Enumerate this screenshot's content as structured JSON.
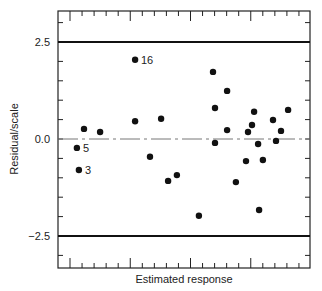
{
  "chart_data": {
    "type": "scatter",
    "title": "",
    "xlabel": "Estimated response",
    "ylabel": "Residual/scale",
    "ylim": [
      -3.3,
      3.4
    ],
    "yticks": [
      2.5,
      0.0,
      -2.5
    ],
    "ytick_labels": [
      "2.5",
      "0.0",
      "−2.5"
    ],
    "reference_lines": [
      {
        "y": 2.5,
        "style": "solid"
      },
      {
        "y": -2.5,
        "style": "solid"
      },
      {
        "y": 0.0,
        "style": "dash-dot"
      }
    ],
    "grid": false,
    "legend": null,
    "x_units": "unlabeled (pixel-relative 0-100 across axis)",
    "points": [
      {
        "x": 7.5,
        "y": -0.23,
        "label": "5"
      },
      {
        "x": 8.3,
        "y": -0.8,
        "label": "3"
      },
      {
        "x": 10.3,
        "y": 0.26
      },
      {
        "x": 16.7,
        "y": 0.18
      },
      {
        "x": 30.6,
        "y": 2.04,
        "label": "16"
      },
      {
        "x": 30.6,
        "y": 0.46
      },
      {
        "x": 36.5,
        "y": -0.46
      },
      {
        "x": 40.9,
        "y": 0.52
      },
      {
        "x": 43.7,
        "y": -1.08
      },
      {
        "x": 47.2,
        "y": -0.93
      },
      {
        "x": 55.9,
        "y": -1.98
      },
      {
        "x": 61.5,
        "y": 1.73
      },
      {
        "x": 62.3,
        "y": 0.8
      },
      {
        "x": 62.3,
        "y": -0.1
      },
      {
        "x": 67.1,
        "y": 1.24
      },
      {
        "x": 67.1,
        "y": 0.23
      },
      {
        "x": 70.6,
        "y": -1.11
      },
      {
        "x": 74.6,
        "y": -0.57
      },
      {
        "x": 75.4,
        "y": 0.18
      },
      {
        "x": 77.0,
        "y": 0.36
      },
      {
        "x": 77.8,
        "y": 0.7
      },
      {
        "x": 79.4,
        "y": -0.13
      },
      {
        "x": 79.8,
        "y": -1.83
      },
      {
        "x": 81.3,
        "y": -0.54
      },
      {
        "x": 85.3,
        "y": 0.49
      },
      {
        "x": 86.5,
        "y": -0.05
      },
      {
        "x": 88.5,
        "y": 0.21
      },
      {
        "x": 91.3,
        "y": 0.75
      }
    ]
  },
  "labels": {
    "xlabel": "Estimated response",
    "ylabel": "Residual/scale",
    "ytick_pos": "2.5",
    "ytick_zero": "0.0",
    "ytick_neg": "−2.5",
    "pt_16": "16",
    "pt_5": "5",
    "pt_3": "3"
  }
}
